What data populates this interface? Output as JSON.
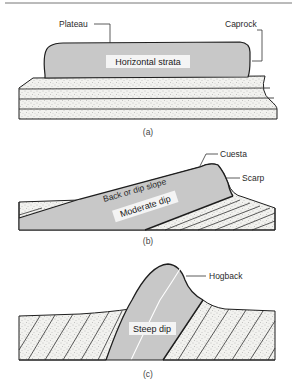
{
  "figure": {
    "panels": [
      {
        "id": "a",
        "caption": "(a)",
        "labels": {
          "left": "Plateau",
          "right": "Caprock",
          "inner": "Horizontal strata"
        }
      },
      {
        "id": "b",
        "caption": "(b)",
        "labels": {
          "top": "Cuesta",
          "right": "Scarp",
          "slope": "Back or dip slope",
          "inner": "Moderate dip"
        }
      },
      {
        "id": "c",
        "caption": "(c)",
        "labels": {
          "right": "Hogback",
          "inner": "Steep dip"
        }
      }
    ]
  },
  "colors": {
    "resistant_layer": "#c8c8c8",
    "sand_fill": "#f1f1ee",
    "line": "#1e1e1e"
  }
}
